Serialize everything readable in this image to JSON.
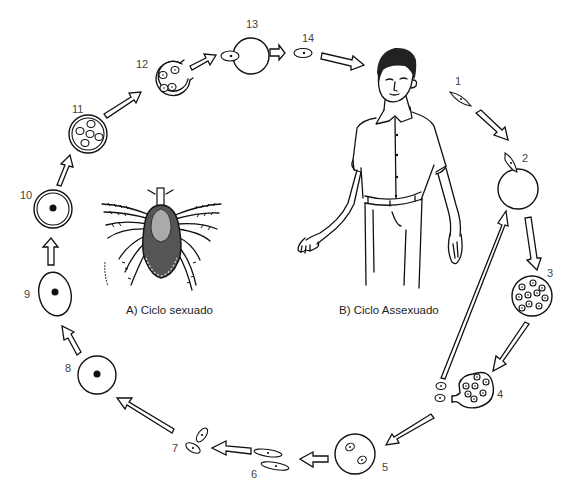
{
  "diagram": {
    "type": "life-cycle",
    "captions": {
      "sexual_cycle": "A) Ciclo sexuado",
      "asexual_cycle": "B) Ciclo Assexuado"
    },
    "figures": {
      "tick": "tick-illustration",
      "human": "human-man-illustration"
    },
    "stages": [
      {
        "label": "1",
        "shape": "spindle sporozoite"
      },
      {
        "label": "2",
        "shape": "sporozoite entering red blood cell"
      },
      {
        "label": "3",
        "shape": "cell with multiple merozoites"
      },
      {
        "label": "4",
        "shape": "rupturing cell releasing merozoites"
      },
      {
        "label": "5",
        "shape": "cell with two parasites"
      },
      {
        "label": "6",
        "shape": "two elongated gametes"
      },
      {
        "label": "7",
        "shape": "two small gametes"
      },
      {
        "label": "8",
        "shape": "zygote circle with nucleus"
      },
      {
        "label": "9",
        "shape": "oval with nucleus"
      },
      {
        "label": "10",
        "shape": "double-walled circle with nucleus"
      },
      {
        "label": "11",
        "shape": "oocyst with sporozoites"
      },
      {
        "label": "12",
        "shape": "rupturing oocyst"
      },
      {
        "label": "13",
        "shape": "cell with emerging sporozoite"
      },
      {
        "label": "14",
        "shape": "free sporozoite"
      }
    ]
  }
}
